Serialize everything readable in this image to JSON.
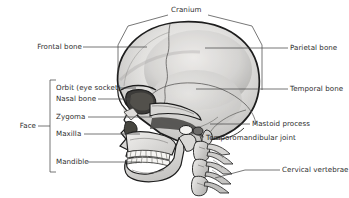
{
  "figure": {
    "background_color": "#ffffff",
    "line_color": "#4a4a4a",
    "text_color": "#2e2e2e",
    "bone_fill": "#e9e8e6",
    "bone_shade": "#b9b8b6",
    "bone_outline": "#1d1d1d"
  },
  "labels": {
    "cranium": "Cranium",
    "frontal_bone": "Frontal bone",
    "parietal_bone": "Parietal bone",
    "temporal_bone": "Temporal bone",
    "orbit": "Orbit (eye socket)",
    "nasal_bone": "Nasal bone",
    "zygoma": "Zygoma",
    "maxilla": "Maxilla",
    "mandible": "Mandible",
    "face": "Face",
    "mastoid_process": "Mastoid process",
    "tmj": "Temporomandibular joint",
    "cervical_vertebrae": "Cervical vertebrae"
  },
  "groups": {
    "cranium_bracket": [
      "Frontal bone",
      "Parietal bone",
      "Temporal bone"
    ],
    "face_bracket": [
      "Orbit (eye socket)",
      "Nasal bone",
      "Zygoma",
      "Maxilla",
      "Mandible"
    ]
  },
  "icons": {
    "skull": "skull-lateral-illustration",
    "vertebrae": "cervical-vertebrae-illustration"
  }
}
